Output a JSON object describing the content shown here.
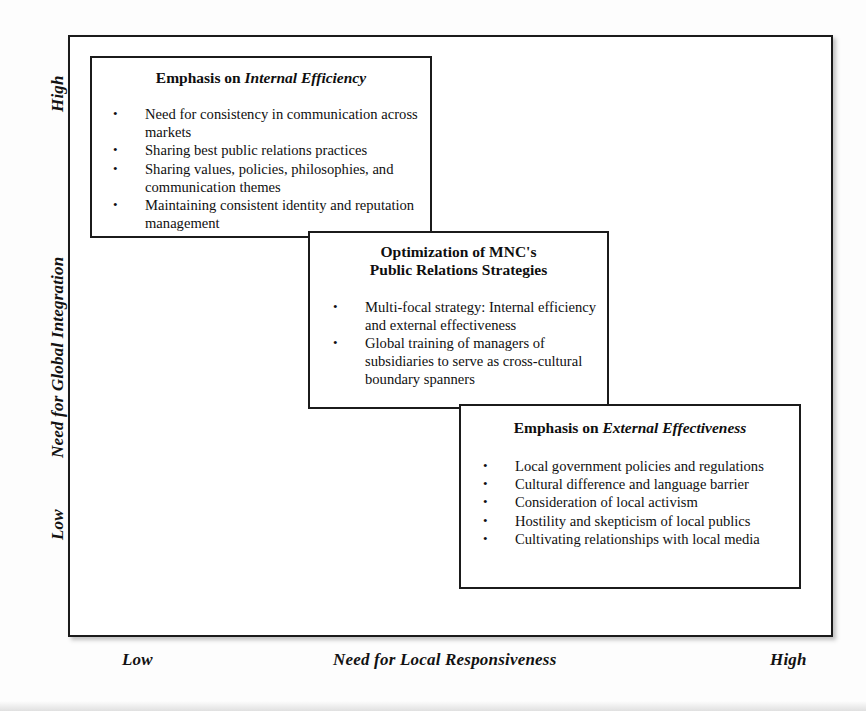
{
  "axes": {
    "y": {
      "title": "Need for Global Integration",
      "high_label": "High",
      "low_label": "Low"
    },
    "x": {
      "title": "Need for Local Responsiveness",
      "low_label": "Low",
      "high_label": "High"
    }
  },
  "boxes": [
    {
      "id": "internal-efficiency",
      "title_plain": "Emphasis on ",
      "title_italic": "Internal Efficiency",
      "bullet_mark": "•",
      "items": [
        "Need for consistency in communication across markets",
        "Sharing best public relations practices",
        "Sharing values, policies, philosophies, and communication themes",
        "Maintaining consistent identity and reputation management"
      ]
    },
    {
      "id": "optimization",
      "title_line1": "Optimization of MNC's",
      "title_line2": "Public Relations Strategies",
      "bullet_mark": "•",
      "items": [
        "Multi-focal strategy: Internal efficiency and external effectiveness",
        "Global training of managers of subsidiaries to serve as cross-cultural boundary spanners"
      ]
    },
    {
      "id": "external-effectiveness",
      "title_plain": "Emphasis on ",
      "title_italic": "External Effectiveness",
      "bullet_mark": "•",
      "items": [
        "Local government policies and regulations",
        "Cultural difference and language barrier",
        "Consideration of local activism",
        "Hostility and skepticism of local publics",
        "Cultivating relationships with local media"
      ]
    }
  ],
  "colors": {
    "border": "#1b1b1b",
    "text": "#111111",
    "background": "#ffffff"
  },
  "chart_data": {
    "type": "diagram",
    "title": "Optimization of MNC's Public Relations Strategies",
    "xlabel": "Need for Local Responsiveness",
    "ylabel": "Need for Global Integration",
    "xlim": [
      "Low",
      "High"
    ],
    "ylim": [
      "Low",
      "High"
    ],
    "grid": false,
    "legend": "none",
    "elements": [
      {
        "label": "Emphasis on Internal Efficiency",
        "x_position": "low",
        "y_position": "high",
        "contents": [
          "Need for consistency in communication across markets",
          "Sharing best public relations practices",
          "Sharing values, policies, philosophies, and communication themes",
          "Maintaining consistent identity and reputation management"
        ]
      },
      {
        "label": "Optimization of MNC's Public Relations Strategies",
        "x_position": "medium",
        "y_position": "medium",
        "contents": [
          "Multi-focal strategy: Internal efficiency and external effectiveness",
          "Global training of managers of subsidiaries to serve as cross-cultural boundary spanners"
        ]
      },
      {
        "label": "Emphasis on External Effectiveness",
        "x_position": "high",
        "y_position": "low",
        "contents": [
          "Local government policies and regulations",
          "Cultural difference and language barrier",
          "Consideration of local activism",
          "Hostility and skepticism of local publics",
          "Cultivating relationships with local media"
        ]
      }
    ]
  }
}
